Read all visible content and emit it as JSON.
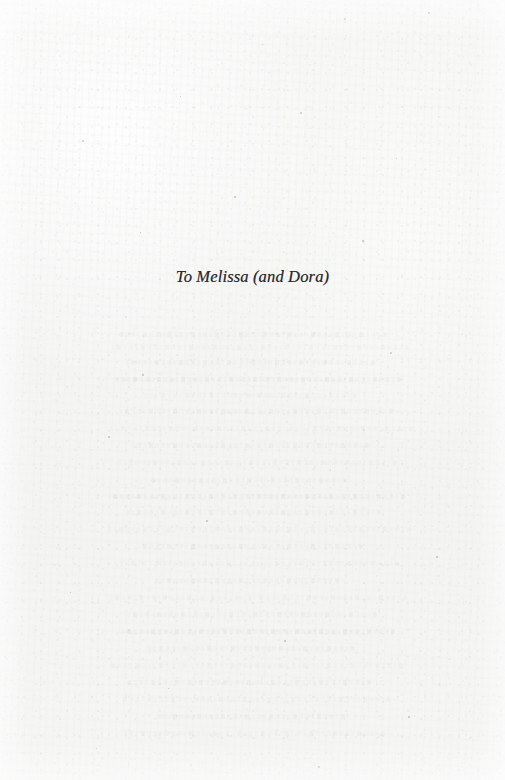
{
  "page": {
    "kind": "book-dedication-page",
    "width": 505,
    "height": 780,
    "paper_color": "#f5f5f4",
    "ink_color": "#2b2b2d"
  },
  "dedication": {
    "text": "To Melissa (and Dora)",
    "style": "italic-serif",
    "alignment": "center"
  },
  "background": {
    "texture": "paper-grain",
    "show_through": {
      "description": "faint mirror-reversed bleed-through text from the reverse page, illegible",
      "legible": false,
      "rows": [
        {
          "top": 332,
          "left": 118,
          "width": 268,
          "weight": "faint"
        },
        {
          "top": 345,
          "left": 96,
          "width": 300,
          "weight": "soft"
        },
        {
          "top": 360,
          "left": 130,
          "width": 250,
          "weight": "faint"
        },
        {
          "top": 377,
          "left": 104,
          "width": 288,
          "weight": "mid"
        },
        {
          "top": 393,
          "left": 148,
          "width": 214,
          "weight": "soft"
        },
        {
          "top": 409,
          "left": 112,
          "width": 274,
          "weight": "faint"
        },
        {
          "top": 426,
          "left": 92,
          "width": 306,
          "weight": "soft"
        },
        {
          "top": 443,
          "left": 136,
          "width": 238,
          "weight": "faint"
        },
        {
          "top": 460,
          "left": 108,
          "width": 280,
          "weight": "soft"
        },
        {
          "top": 478,
          "left": 158,
          "width": 196,
          "weight": "faint"
        },
        {
          "top": 494,
          "left": 100,
          "width": 296,
          "weight": "mid"
        },
        {
          "top": 510,
          "left": 124,
          "width": 258,
          "weight": "faint"
        },
        {
          "top": 527,
          "left": 94,
          "width": 304,
          "weight": "soft"
        },
        {
          "top": 544,
          "left": 142,
          "width": 226,
          "weight": "faint"
        },
        {
          "top": 561,
          "left": 106,
          "width": 284,
          "weight": "soft"
        },
        {
          "top": 578,
          "left": 166,
          "width": 184,
          "weight": "faint"
        },
        {
          "top": 595,
          "left": 98,
          "width": 298,
          "weight": "soft"
        },
        {
          "top": 612,
          "left": 128,
          "width": 252,
          "weight": "faint"
        },
        {
          "top": 629,
          "left": 110,
          "width": 276,
          "weight": "mid"
        },
        {
          "top": 646,
          "left": 150,
          "width": 210,
          "weight": "faint"
        },
        {
          "top": 663,
          "left": 102,
          "width": 292,
          "weight": "soft"
        },
        {
          "top": 680,
          "left": 134,
          "width": 244,
          "weight": "faint"
        },
        {
          "top": 697,
          "left": 114,
          "width": 270,
          "weight": "soft"
        },
        {
          "top": 714,
          "left": 160,
          "width": 190,
          "weight": "faint"
        },
        {
          "top": 731,
          "left": 120,
          "width": 262,
          "weight": "soft"
        }
      ]
    },
    "specks": [
      {
        "left": 344,
        "top": 18,
        "size": 2.2
      },
      {
        "left": 428,
        "top": 12,
        "size": 1.6
      },
      {
        "left": 262,
        "top": 44,
        "size": 1.4
      },
      {
        "left": 180,
        "top": 96,
        "size": 1.3
      },
      {
        "left": 300,
        "top": 112,
        "size": 1.8
      },
      {
        "left": 82,
        "top": 140,
        "size": 1.5
      },
      {
        "left": 396,
        "top": 158,
        "size": 1.4
      },
      {
        "left": 234,
        "top": 196,
        "size": 1.7
      },
      {
        "left": 140,
        "top": 232,
        "size": 1.3
      },
      {
        "left": 362,
        "top": 240,
        "size": 1.5
      },
      {
        "left": 142,
        "top": 374,
        "size": 2.0
      },
      {
        "left": 390,
        "top": 352,
        "size": 2.4
      },
      {
        "left": 108,
        "top": 436,
        "size": 1.6
      },
      {
        "left": 330,
        "top": 470,
        "size": 1.4
      },
      {
        "left": 206,
        "top": 520,
        "size": 1.5
      },
      {
        "left": 436,
        "top": 556,
        "size": 1.7
      },
      {
        "left": 70,
        "top": 592,
        "size": 1.4
      },
      {
        "left": 284,
        "top": 640,
        "size": 1.6
      },
      {
        "left": 168,
        "top": 688,
        "size": 1.3
      },
      {
        "left": 408,
        "top": 716,
        "size": 1.5
      },
      {
        "left": 96,
        "top": 748,
        "size": 1.4
      },
      {
        "left": 318,
        "top": 766,
        "size": 1.6
      }
    ]
  }
}
